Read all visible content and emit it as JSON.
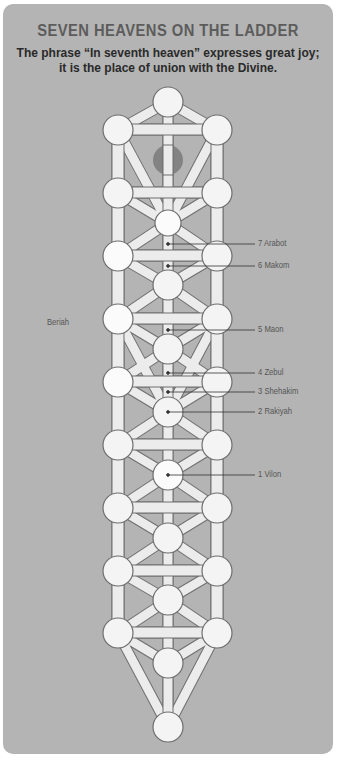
{
  "title": "SEVEN HEAVENS ON THE LADDER",
  "subtitle_line1": "The phrase “In seventh heaven” expresses great joy;",
  "subtitle_line2": "it is the place of union with the Divine.",
  "world_label": "Beriah",
  "heavens": [
    {
      "number": 7,
      "name": "Arabot",
      "label": "7 Arabot"
    },
    {
      "number": 6,
      "name": "Makom",
      "label": "6 Makom"
    },
    {
      "number": 5,
      "name": "Maon",
      "label": "5 Maon"
    },
    {
      "number": 4,
      "name": "Zebul",
      "label": "4 Zebul"
    },
    {
      "number": 3,
      "name": "Shehakim",
      "label": "3 Shehakim"
    },
    {
      "number": 2,
      "name": "Rakiyah",
      "label": "2 Rakiyah"
    },
    {
      "number": 1,
      "name": "Vilon",
      "label": "1 Vilon"
    }
  ],
  "colors": {
    "background": "#b4b4b4",
    "node_fill": "#f4f4f4",
    "node_stroke": "#6e6e6e",
    "path_fill": "#ececec",
    "dark_node": "#7a7a7a",
    "title": "#5c5c5c"
  }
}
